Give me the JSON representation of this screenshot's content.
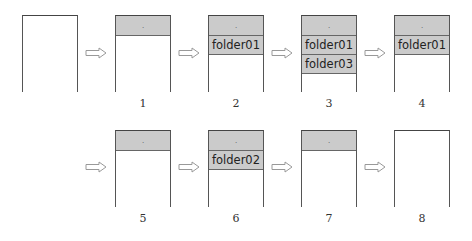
{
  "diagram": {
    "arrow_icon": "hollow-right-arrow",
    "colors": {
      "row_fill": "#cbcbcb",
      "border": "#555555",
      "background": "#ffffff"
    },
    "steps": [
      {
        "label": "",
        "rows": []
      },
      {
        "label": "1",
        "rows": [
          "."
        ]
      },
      {
        "label": "2",
        "rows": [
          ".",
          "folder01"
        ]
      },
      {
        "label": "3",
        "rows": [
          ".",
          "folder01",
          "folder03"
        ]
      },
      {
        "label": "4",
        "rows": [
          ".",
          "folder01"
        ]
      },
      {
        "label": "5",
        "rows": [
          "."
        ]
      },
      {
        "label": "6",
        "rows": [
          ".",
          "folder02"
        ]
      },
      {
        "label": "7",
        "rows": [
          "."
        ]
      },
      {
        "label": "8",
        "rows": []
      }
    ]
  }
}
